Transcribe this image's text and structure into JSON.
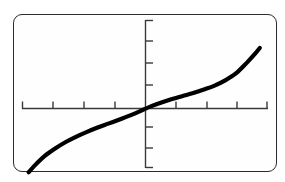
{
  "screen": {
    "device": "graphing-calculator-screen",
    "background_color": "#fefefe",
    "border_color": "#2b2b2b",
    "curve_color": "#000000",
    "axis_color": "#3a3a3a"
  },
  "chart_data": {
    "type": "line",
    "title": "",
    "subtitle": "",
    "xlabel": "",
    "ylabel": "",
    "grid": false,
    "legend": null,
    "annotations": [],
    "axes": {
      "x_axis_visible": true,
      "y_axis_visible": true,
      "x_tick_count": 9,
      "y_tick_count": 7,
      "x_tick_values": [
        -4,
        -3,
        -2,
        -1,
        0,
        1,
        2,
        3,
        4
      ],
      "y_tick_values": [
        -3,
        -2,
        -1,
        0,
        1,
        2,
        3
      ],
      "xlim": [
        -4.6,
        4.6
      ],
      "ylim": [
        -3.4,
        3.4
      ]
    },
    "series": [
      {
        "name": "cube-root-like curve",
        "description": "odd increasing curve resembling y = cube root of x, steep at both ends, flat near origin",
        "x": [
          -4.4,
          -4.1,
          -3.8,
          -3.4,
          -3.0,
          -2.6,
          -2.2,
          -1.8,
          -1.4,
          -1.0,
          -0.6,
          -0.2,
          0.2,
          0.6,
          1.0,
          1.4,
          1.8,
          2.2,
          2.6,
          3.0,
          3.4,
          3.8,
          4.1,
          4.3
        ],
        "y": [
          -2.95,
          -2.55,
          -2.2,
          -1.85,
          -1.55,
          -1.3,
          -1.08,
          -0.88,
          -0.7,
          -0.52,
          -0.33,
          -0.12,
          0.1,
          0.28,
          0.44,
          0.58,
          0.72,
          0.88,
          1.06,
          1.3,
          1.62,
          2.1,
          2.5,
          2.8
        ]
      }
    ]
  }
}
